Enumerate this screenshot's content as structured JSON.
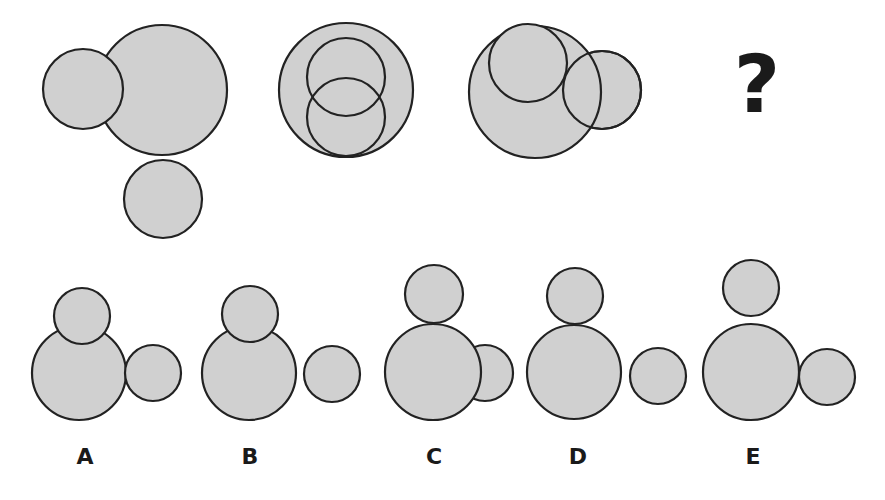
{
  "style": {
    "fill": "#d0d0d0",
    "stroke": "#222222",
    "stroke_width": 2.2,
    "background": "#ffffff"
  },
  "question_mark": {
    "text": "?",
    "x": 757,
    "y": 85
  },
  "sequence": [
    {
      "id": "panel-1",
      "circles": [
        {
          "cx": 162,
          "cy": 90,
          "r": 65
        },
        {
          "cx": 83,
          "cy": 89,
          "r": 40
        },
        {
          "cx": 163,
          "cy": 199,
          "r": 39
        }
      ]
    },
    {
      "id": "panel-2",
      "circles": [
        {
          "cx": 346,
          "cy": 90,
          "r": 67
        },
        {
          "cx": 346,
          "cy": 117,
          "r": 39,
          "fill": "none"
        },
        {
          "cx": 346,
          "cy": 77,
          "r": 39,
          "fill": "none"
        }
      ]
    },
    {
      "id": "panel-3",
      "circles": [
        {
          "cx": 602,
          "cy": 90,
          "r": 39,
          "fill_under": true
        },
        {
          "cx": 535,
          "cy": 92,
          "r": 66
        },
        {
          "cx": 528,
          "cy": 63,
          "r": 39
        },
        {
          "cx": 602,
          "cy": 90,
          "r": 39,
          "fill": "none"
        }
      ]
    }
  ],
  "options": [
    {
      "label": "A",
      "label_x": 85,
      "label_y": 457,
      "circles": [
        {
          "cx": 79,
          "cy": 373,
          "r": 47
        },
        {
          "cx": 153,
          "cy": 373,
          "r": 28
        },
        {
          "cx": 82,
          "cy": 316,
          "r": 28
        }
      ]
    },
    {
      "label": "B",
      "label_x": 250,
      "label_y": 457,
      "circles": [
        {
          "cx": 249,
          "cy": 373,
          "r": 47
        },
        {
          "cx": 332,
          "cy": 374,
          "r": 28
        },
        {
          "cx": 250,
          "cy": 314,
          "r": 28
        }
      ]
    },
    {
      "label": "C",
      "label_x": 434,
      "label_y": 457,
      "circles": [
        {
          "cx": 485,
          "cy": 373,
          "r": 28
        },
        {
          "cx": 433,
          "cy": 372,
          "r": 48
        },
        {
          "cx": 434,
          "cy": 294,
          "r": 29
        }
      ]
    },
    {
      "label": "D",
      "label_x": 578,
      "label_y": 457,
      "circles": [
        {
          "cx": 574,
          "cy": 372,
          "r": 47
        },
        {
          "cx": 658,
          "cy": 376,
          "r": 28
        },
        {
          "cx": 575,
          "cy": 296,
          "r": 28
        }
      ]
    },
    {
      "label": "E",
      "label_x": 753,
      "label_y": 457,
      "circles": [
        {
          "cx": 751,
          "cy": 372,
          "r": 48
        },
        {
          "cx": 827,
          "cy": 377,
          "r": 28
        },
        {
          "cx": 751,
          "cy": 288,
          "r": 28
        }
      ]
    }
  ]
}
